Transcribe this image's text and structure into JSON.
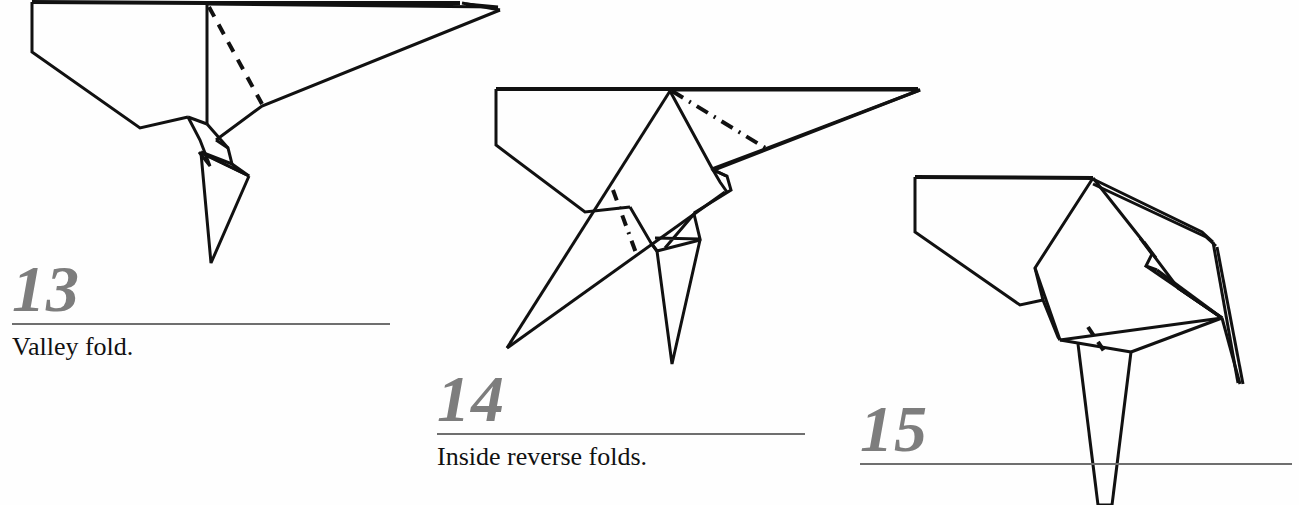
{
  "document": {
    "kind": "origami-instruction-diagrams",
    "background_color": "#fefefe",
    "ink_color": "#111111",
    "number_color": "#7d7d7d",
    "rule_color": "#6f6f6f"
  },
  "steps": [
    {
      "number": "13",
      "caption": "Valley fold.",
      "fold_type": "valley",
      "line_style": "dashed"
    },
    {
      "number": "14",
      "caption": "Inside reverse folds.",
      "fold_type": "mountain",
      "line_style": "dash-dot"
    },
    {
      "number": "15",
      "caption": "",
      "fold_type": "valley",
      "line_style": "dashed"
    }
  ],
  "figures": {
    "fig13": {
      "label": "origami-figure-step-13",
      "outline": "32,2 32,52 140,128 190,118 200,140 206,152 228,176 210,190 216,196 252,196 246,202 210,264 198,196 180,168 166,150 152,126 206,122 206,5 500,10 262,106 215,140",
      "body_path": "M32,2 L32,52 L140,128 L186,117",
      "fold_line": {
        "from": [
          209,
          7
        ],
        "to": [
          262,
          104
        ]
      }
    },
    "fig14": {
      "label": "origami-figure-step-14",
      "fold_lines": [
        {
          "from": [
            670,
            90
          ],
          "to": [
            767,
            148
          ]
        },
        {
          "from": [
            613,
            190
          ],
          "to": [
            636,
            253
          ]
        }
      ]
    },
    "fig15": {
      "label": "origami-figure-step-15",
      "fold_line": {
        "from": [
          1088,
          327
        ],
        "to": [
          1104,
          352
        ]
      }
    }
  }
}
